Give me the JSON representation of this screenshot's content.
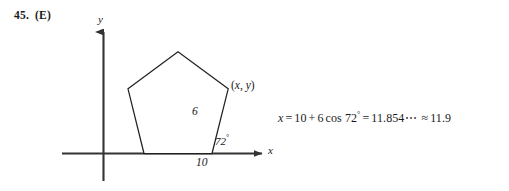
{
  "problem": {
    "number": "45.",
    "answer_choice": "(E)"
  },
  "figure": {
    "axis_label_x": "x",
    "axis_label_y": "y",
    "vertex_label": {
      "open_paren": "(",
      "x": "x",
      "comma": ", ",
      "y": "y",
      "close_paren": ")"
    },
    "side_length_label": "6",
    "base_length_label": "10",
    "angle_label": {
      "value": "72",
      "degree": "°"
    },
    "shape": "regular-pentagon",
    "stroke_color": "#222222",
    "axis_color": "#333333"
  },
  "equation": {
    "lhs_var": "x",
    "eq1": "=",
    "term_a": "10",
    "plus": "+",
    "coefficient": "6",
    "function": "cos",
    "argument": "72",
    "degree": "°",
    "eq2": "=",
    "exact_value": "11.854",
    "ellipsis": "⋯",
    "approx": "≈",
    "rounded_value": "11.9",
    "full_text": "x = 10 + 6 cos 72° = 11.854⋯ ≈ 11.9"
  }
}
